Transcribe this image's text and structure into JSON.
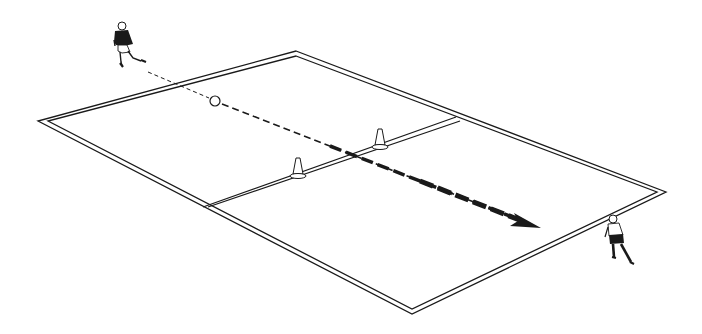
{
  "diagram": {
    "type": "soccer-drill-illustration",
    "background": "#ffffff",
    "line_color": "#1a1a1a",
    "field": {
      "outer_corners": {
        "top": [
          296,
          51
        ],
        "right": [
          666,
          192
        ],
        "bottom": [
          412,
          314
        ],
        "left": [
          38,
          121
        ]
      },
      "inner_corners": {
        "top": [
          296,
          56
        ],
        "right": [
          657,
          192
        ],
        "bottom": [
          412,
          309
        ],
        "left": [
          48,
          121
        ]
      },
      "halfway_line": {
        "from": [
          205,
          205
        ],
        "to": [
          458,
          117
        ]
      }
    },
    "cones": [
      {
        "name": "cone-left",
        "x": 298,
        "y": 176
      },
      {
        "name": "cone-right",
        "x": 380,
        "y": 146
      }
    ],
    "ball": {
      "x": 215,
      "y": 101,
      "r": 5
    },
    "pass_arrow": {
      "thin_from": [
        148,
        72
      ],
      "thin_to": [
        210,
        99
      ],
      "thick_from": [
        222,
        104
      ],
      "thick_to": [
        540,
        228
      ]
    },
    "players": [
      {
        "name": "passer",
        "x": 124,
        "y": 26,
        "kit": "dark-shirt"
      },
      {
        "name": "receiver",
        "x": 614,
        "y": 218,
        "kit": "dark-shorts"
      }
    ]
  }
}
